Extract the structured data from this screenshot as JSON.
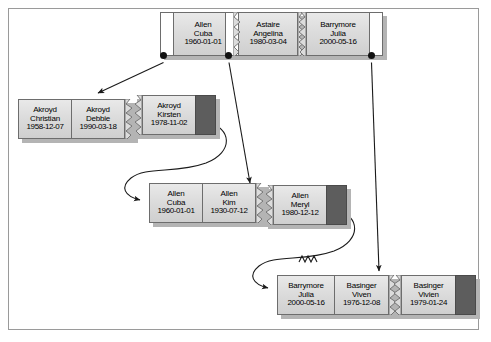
{
  "diagram": {
    "type": "btree-leaf-pages",
    "colors": {
      "frame_border": "#9a9a9a",
      "cell_border": "#6d6d6d",
      "cell_fill": "#dcdcdc",
      "cell_empty": "#ffffff",
      "cell_filled_block": "#5d5d5d",
      "shadow": "#b4b4b4",
      "connector": "#1a1a1a",
      "text": "#000000"
    },
    "pages": [
      {
        "id": "page-top-1",
        "records": [
          {
            "kind": "empty",
            "surname": "",
            "given": "",
            "date": ""
          },
          {
            "kind": "record",
            "surname": "Allen",
            "given": "Cuba",
            "date": "1960-01-01"
          }
        ]
      },
      {
        "id": "page-top-2",
        "records": [
          {
            "kind": "empty",
            "surname": "",
            "given": "",
            "date": ""
          },
          {
            "kind": "record",
            "surname": "Astaire",
            "given": "Angelina",
            "date": "1980-03-04"
          }
        ]
      },
      {
        "id": "page-top-3",
        "records": [
          {
            "kind": "record",
            "surname": "Barrymore",
            "given": "Julia",
            "date": "2000-05-16"
          },
          {
            "kind": "empty",
            "surname": "",
            "given": "",
            "date": ""
          }
        ]
      },
      {
        "id": "page-akroyd-1",
        "records": [
          {
            "kind": "record",
            "surname": "Akroyd",
            "given": "Christian",
            "date": "1958-12-07"
          },
          {
            "kind": "record",
            "surname": "Akroyd",
            "given": "Debbie",
            "date": "1990-03-18"
          }
        ]
      },
      {
        "id": "page-akroyd-2",
        "records": [
          {
            "kind": "record",
            "surname": "Akroyd",
            "given": "Kirsten",
            "date": "1978-11-02"
          },
          {
            "kind": "filled",
            "surname": "",
            "given": "",
            "date": ""
          }
        ]
      },
      {
        "id": "page-allen-1",
        "records": [
          {
            "kind": "record",
            "surname": "Allen",
            "given": "Cuba",
            "date": "1960-01-01"
          },
          {
            "kind": "record",
            "surname": "Allen",
            "given": "Kim",
            "date": "1930-07-12"
          }
        ]
      },
      {
        "id": "page-allen-2",
        "records": [
          {
            "kind": "record",
            "surname": "Allen",
            "given": "Meryl",
            "date": "1980-12-12"
          },
          {
            "kind": "filled",
            "surname": "",
            "given": "",
            "date": ""
          }
        ]
      },
      {
        "id": "page-barrymore-1",
        "records": [
          {
            "kind": "record",
            "surname": "Barrymore",
            "given": "Julia",
            "date": "2000-05-16"
          },
          {
            "kind": "record",
            "surname": "Basinger",
            "given": "Viven",
            "date": "1976-12-08"
          }
        ]
      },
      {
        "id": "page-basinger-2",
        "records": [
          {
            "kind": "record",
            "surname": "Basinger",
            "given": "Vivien",
            "date": "1979-01-24"
          },
          {
            "kind": "filled",
            "surname": "",
            "given": "",
            "date": ""
          }
        ]
      }
    ],
    "pointers": [
      {
        "from": "page-top-1",
        "to": "page-akroyd-1",
        "style": "straight-arrow"
      },
      {
        "from": "page-top-2",
        "to": "page-allen-1",
        "style": "straight-arrow"
      },
      {
        "from": "page-top-3",
        "to": "page-barrymore-1",
        "style": "straight-arrow"
      }
    ],
    "sibling_links": [
      {
        "from": "page-akroyd-2",
        "to": "page-allen-1",
        "style": "curved-arrow"
      },
      {
        "from": "page-allen-2",
        "to": "page-barrymore-1",
        "style": "curved-arrow-torn"
      }
    ]
  }
}
